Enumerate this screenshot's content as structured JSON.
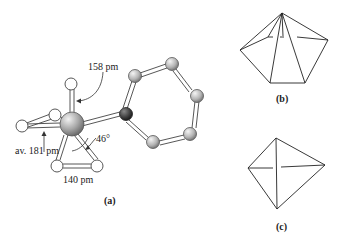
{
  "panels": [
    {
      "id": "a",
      "label": "(a)"
    },
    {
      "id": "b",
      "label": "(b)"
    },
    {
      "id": "c",
      "label": "(c)"
    }
  ],
  "annotations": {
    "bond_top": "158 pm",
    "bond_avg": "av. 181 pm",
    "angle": "46°",
    "bond_bottom": "140 pm"
  },
  "colors": {
    "metal_atom": "#a8a8a8",
    "ring_atom": "#b4b4b4",
    "dark_atom": "#3a3a3a",
    "light_atom": "#ffffff",
    "line": "#333333"
  }
}
